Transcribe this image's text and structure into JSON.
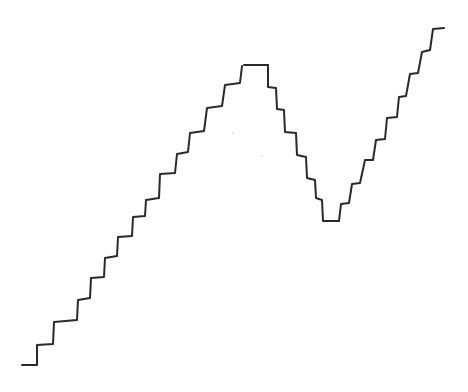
{
  "figure": {
    "stroke_color": "#2a2a2a",
    "background": "#ffffff",
    "segments": [
      {
        "name": "left-ascent",
        "points": [
          [
            22,
            365
          ],
          [
            37,
            365
          ],
          [
            37,
            345
          ],
          [
            53,
            344
          ],
          [
            54,
            322
          ],
          [
            77,
            320
          ],
          [
            78,
            300
          ],
          [
            90,
            298
          ],
          [
            91,
            278
          ],
          [
            104,
            277
          ],
          [
            105,
            258
          ],
          [
            117,
            256
          ],
          [
            118,
            237
          ],
          [
            132,
            236
          ],
          [
            133,
            217
          ],
          [
            145,
            216
          ],
          [
            146,
            200
          ],
          [
            159,
            198
          ],
          [
            160,
            174
          ],
          [
            175,
            173
          ],
          [
            177,
            154
          ],
          [
            188,
            152
          ],
          [
            190,
            133
          ],
          [
            204,
            131
          ],
          [
            207,
            108
          ],
          [
            222,
            106
          ],
          [
            225,
            85
          ],
          [
            240,
            83
          ],
          [
            242,
            66
          ]
        ]
      },
      {
        "name": "peak-plateau",
        "points": [
          [
            244,
            65
          ],
          [
            268,
            65
          ]
        ]
      },
      {
        "name": "descent",
        "points": [
          [
            268,
            65
          ],
          [
            268,
            87
          ],
          [
            276,
            88
          ],
          [
            277,
            109
          ],
          [
            284,
            110
          ],
          [
            285,
            132
          ],
          [
            296,
            133
          ],
          [
            297,
            155
          ],
          [
            306,
            157
          ],
          [
            307,
            178
          ],
          [
            315,
            180
          ],
          [
            316,
            198
          ],
          [
            322,
            200
          ],
          [
            323,
            221
          ],
          [
            339,
            221
          ]
        ]
      },
      {
        "name": "right-ascent",
        "points": [
          [
            339,
            221
          ],
          [
            341,
            204
          ],
          [
            349,
            203
          ],
          [
            352,
            184
          ],
          [
            360,
            183
          ],
          [
            365,
            160
          ],
          [
            373,
            160
          ],
          [
            376,
            140
          ],
          [
            385,
            139
          ],
          [
            387,
            118
          ],
          [
            397,
            117
          ],
          [
            399,
            97
          ],
          [
            406,
            96
          ],
          [
            410,
            74
          ],
          [
            418,
            73
          ],
          [
            422,
            52
          ],
          [
            430,
            50
          ],
          [
            433,
            29
          ],
          [
            444,
            28
          ]
        ]
      }
    ],
    "specks": [
      [
        233,
        133
      ],
      [
        262,
        156
      ]
    ]
  }
}
